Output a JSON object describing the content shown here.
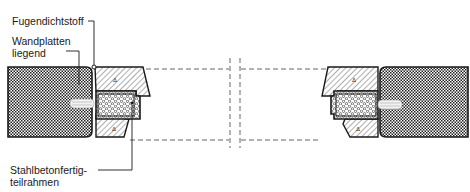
{
  "diagram": {
    "labels": {
      "sealant": "Fugendichtstoff",
      "wall_panels_line1": "Wandplatten",
      "wall_panels_line2": "liegend",
      "frame_line1": "Stahlbetonfertig-",
      "frame_line2": "teilrahmen"
    },
    "colors": {
      "ink": "#1a1a1a",
      "dash": "#555555",
      "background": "#ffffff"
    }
  }
}
